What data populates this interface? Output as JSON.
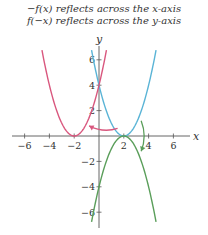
{
  "captions": [
    "−f(x) reflects across the x-axis",
    "f(−x) reflects across the y-axis"
  ],
  "chart_data": {
    "type": "line",
    "title": "",
    "annotations": [
      "−f(x) reflects across the x-axis",
      "f(−x) reflects across the y-axis"
    ],
    "xlabel": "x",
    "ylabel": "y",
    "xlim": [
      -7,
      7
    ],
    "ylim": [
      -7,
      7
    ],
    "x_ticks": [
      -6,
      -4,
      -2,
      2,
      4,
      6
    ],
    "y_ticks": [
      6,
      4,
      2,
      -2,
      -4,
      -6
    ],
    "grid": false,
    "series": [
      {
        "name": "f(x) = (x-2)^2",
        "color": "#5ab4d6",
        "vertex": [
          2,
          0
        ],
        "points": [
          [
            -0.6,
            6.76
          ],
          [
            0,
            4
          ],
          [
            1,
            1
          ],
          [
            2,
            0
          ],
          [
            3,
            1
          ],
          [
            4,
            4
          ],
          [
            4.6,
            6.76
          ]
        ]
      },
      {
        "name": "f(-x) = (x+2)^2",
        "color": "#d9577e",
        "vertex": [
          -2,
          0
        ],
        "points": [
          [
            -4.6,
            6.76
          ],
          [
            -4,
            4
          ],
          [
            -3,
            1
          ],
          [
            -2,
            0
          ],
          [
            -1,
            1
          ],
          [
            0,
            4
          ],
          [
            0.6,
            6.76
          ]
        ]
      },
      {
        "name": "-f(x) = -(x-2)^2",
        "color": "#5a9e5a",
        "vertex": [
          2,
          0
        ],
        "points": [
          [
            -0.6,
            -6.76
          ],
          [
            0,
            -4
          ],
          [
            1,
            -1
          ],
          [
            2,
            0
          ],
          [
            3,
            -1
          ],
          [
            4,
            -4
          ],
          [
            4.6,
            -6.76
          ]
        ]
      }
    ],
    "arrows": [
      {
        "from": [
          1.5,
          0.6
        ],
        "to": [
          -0.8,
          0.8
        ],
        "color": "#d9577e",
        "meaning": "reflect across y-axis"
      },
      {
        "from": [
          3.4,
          1.2
        ],
        "to": [
          3.4,
          -1.2
        ],
        "color": "#5a9e5a",
        "meaning": "reflect across x-axis"
      }
    ]
  }
}
